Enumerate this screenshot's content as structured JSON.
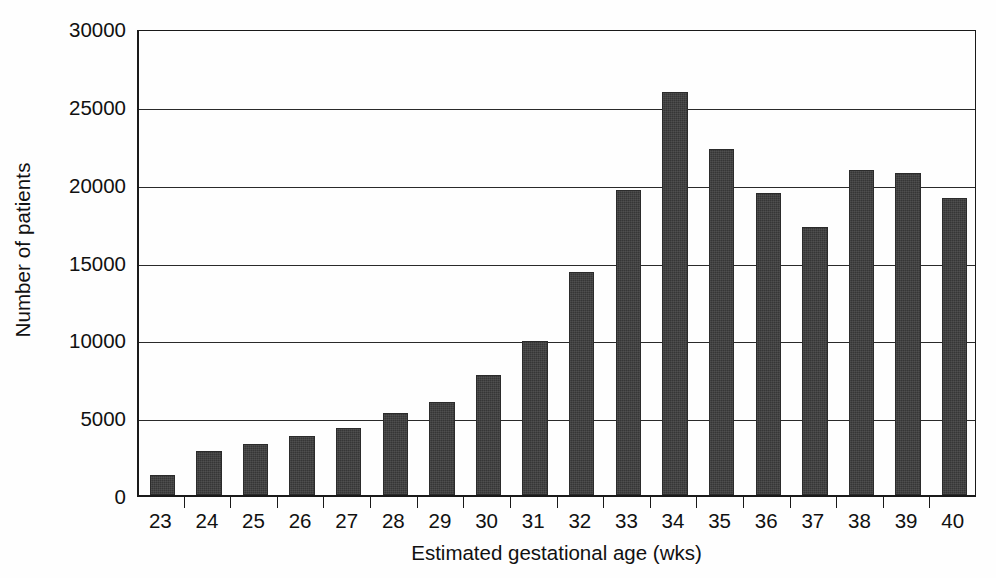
{
  "chart_data": {
    "type": "bar",
    "title": "",
    "subtitle": "",
    "xlabel": "Estimated gestational age (wks)",
    "ylabel": "Number of patients",
    "categories": [
      "23",
      "24",
      "25",
      "26",
      "27",
      "28",
      "29",
      "30",
      "31",
      "32",
      "33",
      "34",
      "35",
      "36",
      "37",
      "38",
      "39",
      "40"
    ],
    "values": [
      1300,
      2800,
      3300,
      3800,
      4300,
      5300,
      6000,
      7700,
      9900,
      14300,
      19600,
      25900,
      22200,
      19400,
      17200,
      20900,
      20700,
      19100
    ],
    "ylim": [
      0,
      30000
    ],
    "ytick_values": [
      0,
      5000,
      10000,
      15000,
      20000,
      25000,
      30000
    ],
    "ytick_labels": [
      "0",
      "5000",
      "10000",
      "15000",
      "20000",
      "25000",
      "30000"
    ],
    "grid": "horizontal",
    "legend": "none",
    "bar_color": "#363636",
    "axis_color": "#1a1a1a",
    "background_color": "#fefefe",
    "annotations": []
  }
}
